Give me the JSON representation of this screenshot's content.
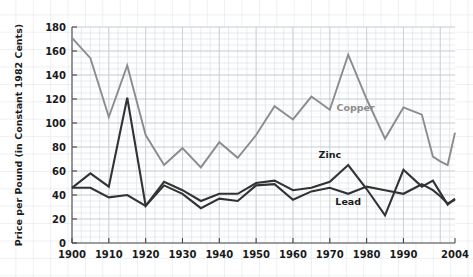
{
  "chart_data": {
    "type": "line",
    "title": "",
    "xlabel": "",
    "ylabel": "Price per Pound (in Constant 1982 Cents)",
    "xlim": [
      1900,
      2004
    ],
    "ylim": [
      0,
      180
    ],
    "ytick_step": 20,
    "xtick_step": 10,
    "grid": true,
    "legend_position": "inline-annotations",
    "xticks": [
      "1900",
      "1910",
      "1920",
      "1930",
      "1940",
      "1950",
      "1960",
      "1970",
      "1980",
      "1990",
      "2004"
    ],
    "yticks": [
      "0",
      "20",
      "40",
      "60",
      "80",
      "100",
      "120",
      "140",
      "160",
      "180"
    ],
    "x": [
      1900,
      1905,
      1910,
      1915,
      1920,
      1925,
      1930,
      1935,
      1940,
      1945,
      1950,
      1955,
      1960,
      1965,
      1970,
      1975,
      1980,
      1985,
      1990,
      1995,
      1998,
      2000,
      2002,
      2004
    ],
    "series": [
      {
        "name": "Copper",
        "color": "#8c8c8c",
        "label_x": 1977,
        "label_y": 110,
        "values": [
          171,
          154,
          105,
          148,
          90,
          65,
          79,
          63,
          84,
          71,
          90,
          114,
          103,
          122,
          111,
          157,
          120,
          87,
          113,
          107,
          72,
          68,
          65,
          92
        ]
      },
      {
        "name": "Zinc",
        "color": "#333333",
        "label_x": 1970,
        "label_y": 71,
        "values": [
          46,
          58,
          47,
          121,
          31,
          51,
          44,
          35,
          41,
          41,
          50,
          52,
          44,
          46,
          51,
          65,
          45,
          23,
          61,
          47,
          52,
          42,
          32,
          37
        ]
      },
      {
        "name": "Lead",
        "color": "#333333",
        "label_x": 1975,
        "label_y": 32,
        "values": [
          46,
          46,
          38,
          40,
          31,
          48,
          41,
          29,
          37,
          35,
          48,
          49,
          36,
          43,
          46,
          41,
          47,
          44,
          41,
          49,
          44,
          39,
          33,
          36
        ]
      }
    ]
  },
  "axis": {
    "ylabel": "Price per Pound (in Constant 1982 Cents)"
  }
}
